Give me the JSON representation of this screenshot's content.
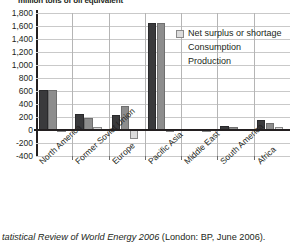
{
  "figure": {
    "unit_title": "million tons of oil equivalent",
    "caption_italic": "tatistical Review of World Energy 2006",
    "caption_rest": " (London: BP, June 2006)."
  },
  "legend": {
    "position": "inside-top-right",
    "items": [
      {
        "label": "Net surplus or shortage",
        "color": "#dcdcdc",
        "key": "net"
      },
      {
        "label": "Consumption",
        "color": "#8d8d8d",
        "key": "consumption"
      },
      {
        "label": "Production",
        "color": "#3a3a3c",
        "key": "production"
      }
    ]
  },
  "axis": {
    "y_ticks": [
      "1,800",
      "1,600",
      "1,400",
      "1,200",
      "1,000",
      "800",
      "600",
      "400",
      "200",
      "0",
      "-200",
      "-400"
    ]
  },
  "chart_data": {
    "type": "bar",
    "title": "",
    "subtitle": "",
    "xlabel": "",
    "ylabel": "million tons of oil equivalent",
    "ylim": [
      -400,
      1800
    ],
    "ytick_step": 200,
    "grid": true,
    "legend_position": "inside-top-right",
    "categories": [
      "North America",
      "Former Soviet Union",
      "Europe",
      "Pacific Asia",
      "Middle East",
      "South America",
      "Africa"
    ],
    "series": [
      {
        "name": "Production",
        "color": "#3a3a3c",
        "values": [
          620,
          240,
          225,
          1650,
          18,
          55,
          150
        ]
      },
      {
        "name": "Consumption",
        "color": "#8d8d8d",
        "values": [
          620,
          190,
          370,
          1650,
          14,
          40,
          102
        ]
      },
      {
        "name": "Net surplus or shortage",
        "color": "#dcdcdc",
        "values": [
          5,
          50,
          -145,
          5,
          5,
          15,
          45
        ]
      }
    ]
  }
}
